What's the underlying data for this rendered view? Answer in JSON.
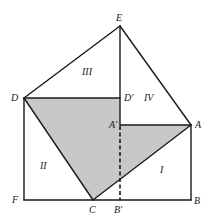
{
  "diagram": {
    "shade_color": "#c8c8c8",
    "line_color": "#1a1a1a",
    "points": {
      "E": "E",
      "D": "D",
      "D_prime": "D′",
      "A_prime": "A′",
      "A": "A",
      "B": "B",
      "B_prime": "B′",
      "C": "C",
      "F": "F"
    },
    "regions": {
      "I": "I",
      "II": "II",
      "III": "III",
      "IV": "IV"
    },
    "shaded_polygon": [
      "D",
      "D′",
      "A′",
      "A",
      "C"
    ],
    "dashed_segment": [
      "A′",
      "B′"
    ],
    "solid_segments": [
      [
        "E",
        "D"
      ],
      [
        "E",
        "A"
      ],
      [
        "E",
        "D′"
      ],
      [
        "D",
        "D′"
      ],
      [
        "D",
        "F"
      ],
      [
        "F",
        "B"
      ],
      [
        "B",
        "A"
      ],
      [
        "A",
        "A′"
      ],
      [
        "D",
        "C"
      ],
      [
        "C",
        "A"
      ]
    ]
  }
}
